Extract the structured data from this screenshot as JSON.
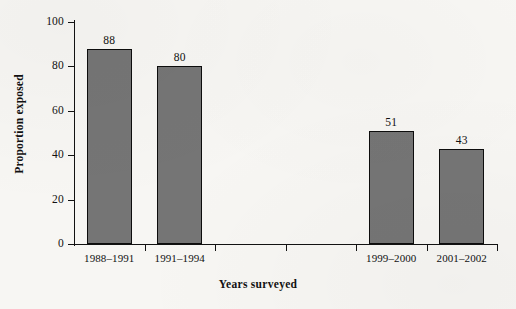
{
  "chart_data": {
    "type": "bar",
    "title": "",
    "xlabel": "Years surveyed",
    "ylabel": "Proportion exposed",
    "categories": [
      "1988–1991",
      "1991–1994",
      "",
      "",
      "1999–2000",
      "2001–2002"
    ],
    "values": [
      88,
      80,
      null,
      null,
      51,
      43
    ],
    "value_labels": [
      "88",
      "80",
      "",
      "",
      "51",
      "43"
    ],
    "ylim": [
      0,
      100
    ],
    "yticks": [
      0,
      20,
      40,
      60,
      80,
      100
    ],
    "ytick_labels": [
      "0",
      "20",
      "40",
      "60",
      "80",
      "100"
    ],
    "grid": false,
    "legend": false,
    "bar_color": "#757575",
    "bar_edge_color": "#0d0d0d",
    "axis_color": "#121212",
    "background": "#f7f6f3"
  },
  "axes": {
    "y_title": "Proportion exposed",
    "x_title": "Years surveyed"
  },
  "bars": [
    {
      "label": "1988–1991",
      "value": 88,
      "value_text": "88"
    },
    {
      "label": "1991–1994",
      "value": 80,
      "value_text": "80"
    },
    {
      "label": "1999–2000",
      "value": 51,
      "value_text": "51"
    },
    {
      "label": "2001–2002",
      "value": 43,
      "value_text": "43"
    }
  ]
}
